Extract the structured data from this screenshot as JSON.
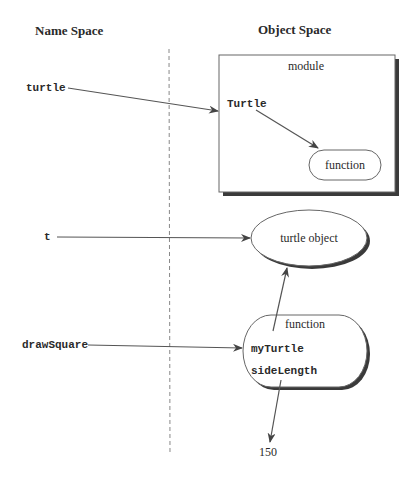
{
  "headers": {
    "name_space": "Name Space",
    "object_space": "Object Space"
  },
  "names": {
    "turtle": "turtle",
    "t": "t",
    "drawSquare": "drawSquare"
  },
  "objects": {
    "module": {
      "label": "module",
      "inner_name": "Turtle",
      "inner_object": "function"
    },
    "turtle_object": {
      "label": "turtle object"
    },
    "function": {
      "label": "function",
      "params": [
        "myTurtle",
        "sideLength"
      ]
    },
    "value": "150"
  },
  "colors": {
    "line": "#555555",
    "text": "#2a2a2a",
    "shadow": "#3a3a3a",
    "divider": "#888888"
  }
}
